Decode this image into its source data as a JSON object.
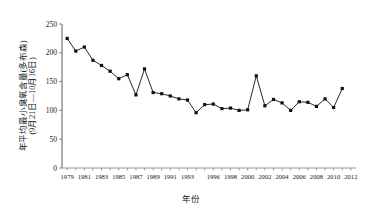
{
  "chart_data": {
    "type": "line",
    "title": "",
    "xlabel": "年份",
    "ylabel": "年平均最小臭氧含量(多布森)(9月21日—10月16日)",
    "ylabel_line1": "年平均最小臭氧含量(多布森)",
    "ylabel_line2": "(9月21日—10月16日)",
    "xlim": [
      1978.4,
      2012.6
    ],
    "ylim": [
      0,
      250
    ],
    "yticks": [
      0,
      50,
      100,
      150,
      200,
      250
    ],
    "ytick_labels": [
      "0",
      "50",
      "100",
      "150",
      "200",
      "250"
    ],
    "xtick_labels": [
      "1979",
      "1981",
      "1983",
      "1985",
      "1987",
      "1989",
      "1991",
      "1993",
      "1996",
      "1998",
      "2000",
      "2002",
      "2004",
      "2006",
      "2008",
      "2010",
      "2012"
    ],
    "xtick_values": [
      1979,
      1981,
      1983,
      1985,
      1987,
      1989,
      1991,
      1993,
      1996,
      1998,
      2000,
      2002,
      2004,
      2006,
      2008,
      2010,
      2012
    ],
    "grid": false,
    "legend": false,
    "legend_position": "none",
    "marker": "square",
    "marker_color": "#111111",
    "line_color": "#111111",
    "axis_color": "#8a8a8a",
    "background": "#ffffff",
    "x": [
      1979,
      1980,
      1981,
      1982,
      1983,
      1984,
      1985,
      1986,
      1987,
      1988,
      1989,
      1990,
      1991,
      1992,
      1993,
      1994,
      1995,
      1996,
      1997,
      1998,
      1999,
      2000,
      2001,
      2002,
      2003,
      2004,
      2005,
      2006,
      2007,
      2008,
      2009,
      2010,
      2011
    ],
    "values": [
      225,
      203,
      210,
      187,
      178,
      168,
      155,
      162,
      127,
      172,
      131,
      129,
      125,
      120,
      118,
      96,
      110,
      111,
      103,
      104,
      100,
      101,
      160,
      108,
      119,
      113,
      100,
      115,
      114,
      107,
      120,
      105,
      138
    ],
    "series": [
      {
        "name": "年平均最小臭氧含量",
        "values": [
          225,
          203,
          210,
          187,
          178,
          168,
          155,
          162,
          127,
          172,
          131,
          129,
          125,
          120,
          118,
          96,
          110,
          111,
          103,
          104,
          100,
          101,
          160,
          108,
          119,
          113,
          100,
          115,
          114,
          107,
          120,
          105,
          138
        ]
      }
    ]
  }
}
